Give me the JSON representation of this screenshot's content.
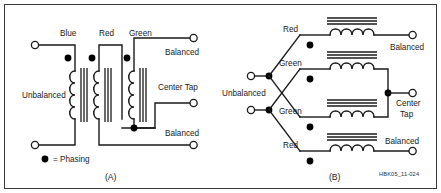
{
  "figure": {
    "id_label": "HBK05_11-024",
    "background_color": "#ffffff",
    "line_color": "#1a1a1a",
    "border_color": "#3a3a3a"
  },
  "legend": {
    "symbol": "phasing-dot",
    "text": "= Phasing"
  },
  "panel_a": {
    "caption": "(A)",
    "input_label": "Unbalanced",
    "winding_labels": {
      "primary": "Blue",
      "secondary_left": "Red",
      "secondary_right": "Green"
    },
    "output_labels": {
      "top": "Balanced",
      "middle": "Center Tap",
      "bottom": "Balanced"
    }
  },
  "panel_b": {
    "caption": "(B)",
    "input_label": "Unbalanced",
    "rows": [
      {
        "winding": "Red",
        "output": "Balanced"
      },
      {
        "winding": "Green",
        "output": ""
      },
      {
        "winding": "Green",
        "output": ""
      },
      {
        "winding": "Red",
        "output": "Balanced"
      }
    ],
    "center_tap_label_line1": "Center",
    "center_tap_label_line2": "Tap"
  }
}
